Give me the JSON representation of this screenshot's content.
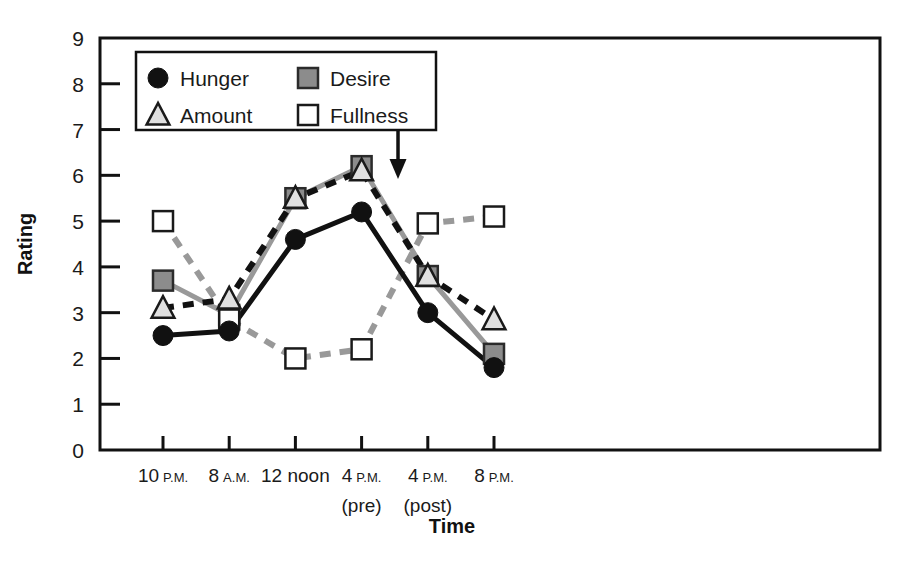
{
  "chart_data": {
    "type": "line",
    "title": "",
    "xlabel": "Time",
    "ylabel": "Rating",
    "ylim": [
      0,
      9
    ],
    "yticks": [
      0,
      1,
      2,
      3,
      4,
      5,
      6,
      7,
      8,
      9
    ],
    "grid": false,
    "legend_position": "top-left-inside",
    "categories": [
      "10 P.M.",
      "8 A.M.",
      "12 noon",
      "4 P.M. (pre)",
      "4 P.M. (post)",
      "8 P.M."
    ],
    "x_tick_labels": [
      {
        "main": "10",
        "suffix": "P.M.",
        "second_line": ""
      },
      {
        "main": "8",
        "suffix": "A.M.",
        "second_line": ""
      },
      {
        "main": "12 noon",
        "suffix": "",
        "second_line": ""
      },
      {
        "main": "4",
        "suffix": "P.M.",
        "second_line": "(pre)"
      },
      {
        "main": "4",
        "suffix": "P.M.",
        "second_line": "(post)"
      },
      {
        "main": "8",
        "suffix": "P.M.",
        "second_line": ""
      }
    ],
    "series": [
      {
        "name": "Hunger",
        "marker": "filled-circle",
        "line_style": "solid",
        "color": "#111111",
        "marker_fill": "#111111",
        "marker_stroke": "#111111",
        "values": [
          2.5,
          2.6,
          4.6,
          5.2,
          3.0,
          1.8
        ]
      },
      {
        "name": "Desire",
        "marker": "filled-square",
        "line_style": "solid",
        "color": "#999999",
        "marker_fill": "#8c8c8c",
        "marker_stroke": "#2b2b2b",
        "values": [
          3.7,
          2.95,
          5.5,
          6.2,
          3.8,
          2.1
        ]
      },
      {
        "name": "Amount",
        "marker": "triangle",
        "line_style": "dashed",
        "color": "#111111",
        "marker_fill": "#e0e0e0",
        "marker_stroke": "#1a1a1a",
        "values": [
          3.1,
          3.3,
          5.5,
          6.1,
          3.8,
          2.85
        ]
      },
      {
        "name": "Fullness",
        "marker": "open-square",
        "line_style": "dashed",
        "color": "#999999",
        "marker_fill": "#ffffff",
        "marker_stroke": "#1a1a1a",
        "values": [
          5.0,
          2.85,
          2.0,
          2.2,
          4.95,
          5.1
        ]
      }
    ],
    "annotations": [
      {
        "text": "Meal",
        "x_fraction": 3.55,
        "y_value": 7.55,
        "arrow": "down-arrow",
        "arrow_from_y": 7.15,
        "arrow_to_y": 6.05
      }
    ]
  },
  "legend": {
    "entries": [
      {
        "label": "Hunger",
        "marker": "filled-circle"
      },
      {
        "label": "Desire",
        "marker": "filled-square"
      },
      {
        "label": "Amount",
        "marker": "triangle"
      },
      {
        "label": "Fullness",
        "marker": "open-square"
      }
    ]
  },
  "colors": {
    "axis": "#111111",
    "dark_series": "#111111",
    "gray_series": "#999999",
    "gray_marker_fill": "#8c8c8c",
    "light_marker_fill": "#e0e0e0",
    "background": "#ffffff"
  }
}
